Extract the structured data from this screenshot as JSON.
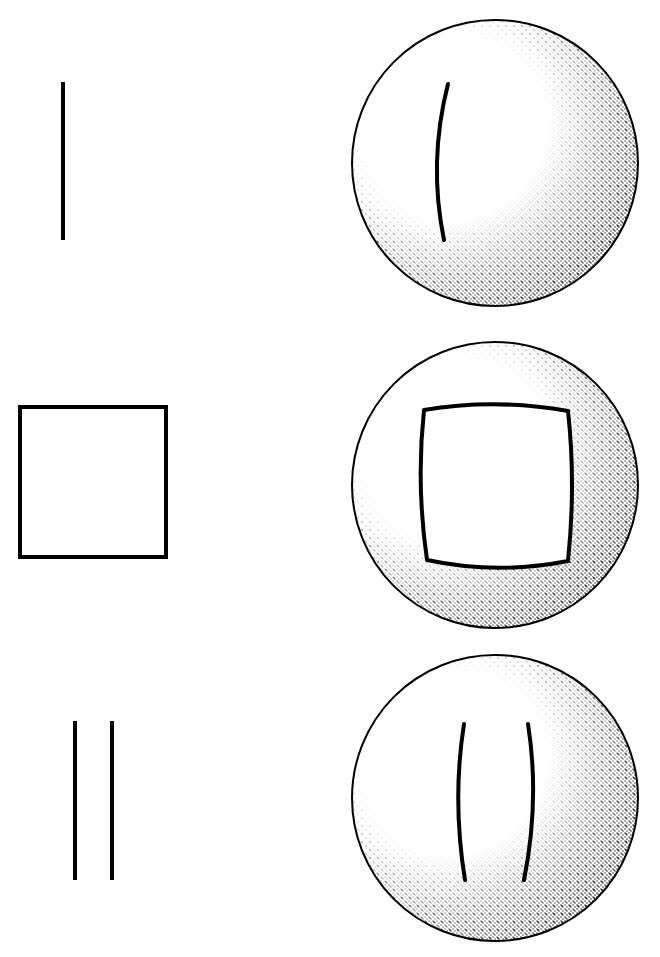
{
  "diagram": {
    "title": "",
    "colors": {
      "ink": "#000000",
      "paper": "#ffffff"
    },
    "rows": [
      {
        "id": "single-line",
        "flat": {
          "type": "line",
          "x1": 63,
          "y1": 82,
          "x2": 63,
          "y2": 240
        },
        "sphere": {
          "cx": 495,
          "cy": 163,
          "r": 143,
          "projected": "single outward-bowed curve"
        }
      },
      {
        "id": "square",
        "flat": {
          "type": "rect",
          "x": 20,
          "y": 407,
          "w": 146,
          "h": 150
        },
        "sphere": {
          "cx": 495,
          "cy": 485,
          "r": 143,
          "projected": "square with concave (pincushion) sides"
        }
      },
      {
        "id": "parallel-lines",
        "flat": {
          "type": "double-line",
          "xs": [
            75,
            112
          ],
          "y1": 721,
          "y2": 880
        },
        "sphere": {
          "cx": 495,
          "cy": 798,
          "r": 143,
          "projected": "two lines bowing away from each other"
        }
      }
    ]
  }
}
